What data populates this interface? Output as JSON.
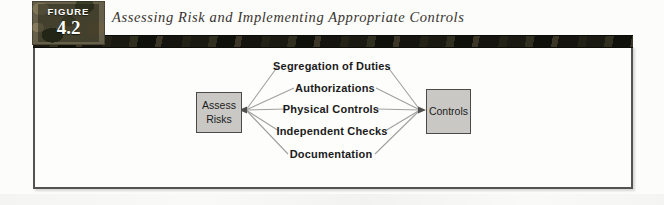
{
  "figure": {
    "kicker": "FIGURE",
    "number": "4.2",
    "title": "Assessing Risk and Implementing Appropriate Controls"
  },
  "diagram": {
    "source_node": {
      "label": "Assess Risks",
      "lines": [
        "Assess",
        "Risks"
      ]
    },
    "target_node": {
      "label": "Controls"
    },
    "control_labels": [
      "Segregation of Duties",
      "Authorizations",
      "Physical Controls",
      "Independent Checks",
      "Documentation"
    ]
  },
  "colors": {
    "node_fill": "#c9c8c5",
    "node_border": "#4a4a48",
    "connector": "#a0a0a0",
    "panel_border": "#55534f",
    "banner_dark": "#16150f",
    "badge_text": "#ffffff"
  }
}
